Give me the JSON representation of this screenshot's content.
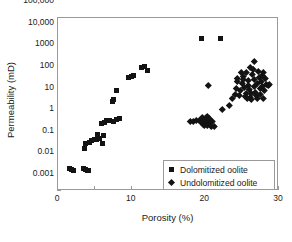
{
  "chart_data": {
    "type": "scatter",
    "title": "",
    "xlabel": "Porosity (%)",
    "ylabel": "Permeability (mD)",
    "xlim": [
      0,
      30
    ],
    "ylim": [
      0.001,
      100000
    ],
    "yscale": "log",
    "xscale": "linear",
    "grid": false,
    "legend_position": "inside-bottom-right",
    "x_ticks": [
      0,
      10,
      20,
      30
    ],
    "x_tick_labels": [
      "0",
      "10",
      "20",
      "30"
    ],
    "x_minor_ticks": [
      5,
      15,
      25
    ],
    "y_ticks": [
      0.001,
      0.01,
      0.1,
      1,
      10,
      100,
      1000,
      10000,
      100000
    ],
    "y_tick_labels": [
      "0.001",
      "0.01",
      "0.1",
      "1",
      "10",
      "100",
      "1000",
      "10,000",
      "100,000"
    ],
    "series": [
      {
        "name": "Dolomitized oolite",
        "marker": "square",
        "color": "#131313",
        "points": [
          [
            1.6,
            0.0105
          ],
          [
            1.9,
            0.0098
          ],
          [
            2.1,
            0.0092
          ],
          [
            3.5,
            0.0105
          ],
          [
            3.7,
            0.0098
          ],
          [
            4.0,
            0.0092
          ],
          [
            4.2,
            0.009
          ],
          [
            3.6,
            0.092
          ],
          [
            3.7,
            0.155
          ],
          [
            4.3,
            0.175
          ],
          [
            4.6,
            0.215
          ],
          [
            5.0,
            0.245
          ],
          [
            5.2,
            0.235
          ],
          [
            5.3,
            0.42
          ],
          [
            5.6,
            0.26
          ],
          [
            6.0,
            0.155
          ],
          [
            6.2,
            0.36
          ],
          [
            5.9,
            1.35
          ],
          [
            6.3,
            1.5
          ],
          [
            6.6,
            1.75
          ],
          [
            7.0,
            1.8
          ],
          [
            7.6,
            1.7
          ],
          [
            8.0,
            2.1
          ],
          [
            8.4,
            2.2
          ],
          [
            7.4,
            13.5
          ],
          [
            7.5,
            17.0
          ],
          [
            7.9,
            45.0
          ],
          [
            9.6,
            175.0
          ],
          [
            10.0,
            200.0
          ],
          [
            10.3,
            230.0
          ],
          [
            11.4,
            520.0
          ],
          [
            11.7,
            560.0
          ],
          [
            12.2,
            360.0
          ],
          [
            19.5,
            11500.0
          ],
          [
            22.1,
            11800.0
          ]
        ]
      },
      {
        "name": "Undolomitized oolite",
        "marker": "diamond",
        "color": "#131313",
        "points": [
          [
            18.0,
            1.75
          ],
          [
            18.4,
            1.7
          ],
          [
            18.8,
            1.8
          ],
          [
            19.2,
            1.9
          ],
          [
            19.4,
            2.1
          ],
          [
            19.5,
            1.45
          ],
          [
            19.6,
            2.6
          ],
          [
            19.7,
            1.25
          ],
          [
            19.8,
            1.15
          ],
          [
            19.9,
            2.0
          ],
          [
            20.0,
            1.6
          ],
          [
            20.1,
            2.5
          ],
          [
            20.2,
            1.05
          ],
          [
            20.3,
            2.9
          ],
          [
            20.4,
            1.8
          ],
          [
            20.5,
            1.35
          ],
          [
            20.6,
            2.2
          ],
          [
            20.7,
            1.5
          ],
          [
            20.8,
            1.0
          ],
          [
            21.0,
            1.7
          ],
          [
            21.2,
            0.95
          ],
          [
            20.4,
            80.0
          ],
          [
            22.3,
            6.2
          ],
          [
            23.6,
            19.0
          ],
          [
            24.0,
            30.0
          ],
          [
            24.2,
            55.0
          ],
          [
            24.4,
            120.0
          ],
          [
            24.6,
            26.0
          ],
          [
            24.8,
            44.0
          ],
          [
            25.0,
            95.0
          ],
          [
            25.1,
            210.0
          ],
          [
            25.2,
            150.0
          ],
          [
            25.3,
            60.0
          ],
          [
            25.4,
            25.0
          ],
          [
            25.5,
            32.0
          ],
          [
            25.6,
            300.0
          ],
          [
            25.8,
            80.0
          ],
          [
            25.9,
            130.0
          ],
          [
            26.0,
            48.0
          ],
          [
            26.1,
            22.0
          ],
          [
            26.2,
            18.0
          ],
          [
            26.3,
            33.0
          ],
          [
            26.4,
            260.0
          ],
          [
            26.5,
            420.0
          ],
          [
            26.6,
            150.0
          ],
          [
            26.7,
            70.0
          ],
          [
            26.8,
            38.0
          ],
          [
            26.9,
            26.0
          ],
          [
            27.0,
            20.0
          ],
          [
            27.1,
            95.0
          ],
          [
            27.2,
            330.0
          ],
          [
            27.3,
            180.0
          ],
          [
            27.4,
            55.0
          ],
          [
            27.5,
            30.0
          ],
          [
            27.6,
            120.0
          ],
          [
            27.7,
            230.0
          ],
          [
            27.8,
            72.0
          ],
          [
            27.9,
            19.0
          ],
          [
            28.0,
            44.0
          ],
          [
            28.1,
            160.0
          ],
          [
            28.3,
            90.0
          ],
          [
            28.5,
            78.0
          ],
          [
            28.7,
            88.0
          ],
          [
            26.6,
            1000.0
          ],
          [
            27.9,
            300.0
          ],
          [
            23.2,
            9.5
          ],
          [
            24.9,
            320.0
          ],
          [
            25.7,
            19.0
          ],
          [
            26.05,
            500.0
          ],
          [
            24.3,
            160.0
          ]
        ]
      }
    ]
  },
  "legend": {
    "entries": [
      {
        "label": "Dolomitized oolite"
      },
      {
        "label": "Undolomitized oolite"
      }
    ]
  }
}
